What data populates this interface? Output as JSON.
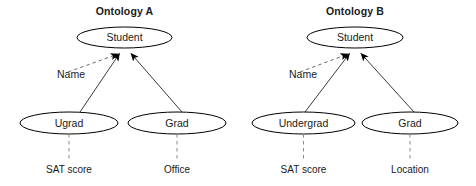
{
  "figure": {
    "type": "ontology-mapping-diagram",
    "background_color": "#ffffff",
    "width": 476,
    "height": 186
  },
  "panels": [
    {
      "id": "ontology-a",
      "title": "Ontology A",
      "root_node": "Student",
      "subclasses": [
        {
          "name": "Ugrad",
          "attribute": "SAT score"
        },
        {
          "name": "Grad",
          "attribute": "Office"
        }
      ],
      "property_label": "Name"
    },
    {
      "id": "ontology-b",
      "title": "Ontology B",
      "root_node": "Student",
      "subclasses": [
        {
          "name": "Undergrad",
          "attribute": "SAT score"
        },
        {
          "name": "Grad",
          "attribute": "Location"
        }
      ],
      "property_label": "Name"
    }
  ],
  "legend_semantics": {
    "solid_arrow": "is-a / subclass relation",
    "dashed_arrow": "property relation",
    "dashed_line": "attribute attachment"
  },
  "colors": {
    "node_stroke": "#000000",
    "node_fill": "#ffffff",
    "text": "#1a1a1a",
    "solid_edge": "#3a3a3a",
    "dashed_edge": "#6a6a6a",
    "attribute_link": "#8a8a8a",
    "arrowhead": "#000000"
  }
}
